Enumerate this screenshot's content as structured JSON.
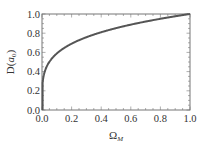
{
  "chart_data": {
    "type": "line",
    "title": "",
    "xlabel": "Ω_M",
    "xlabel_main": "Ω",
    "xlabel_sub": "M",
    "ylabel": "D(a_0)",
    "ylabel_main": "D(",
    "ylabel_var": "a",
    "ylabel_sub": "0",
    "ylabel_close": ")",
    "xlim": [
      0.0,
      1.0
    ],
    "ylim": [
      0.0,
      1.0
    ],
    "xticks": [
      "0.0",
      "0.2",
      "0.4",
      "0.6",
      "0.8",
      "1.0"
    ],
    "yticks": [
      "0.0",
      "0.2",
      "0.4",
      "0.6",
      "0.8",
      "1.0"
    ],
    "grid": false,
    "legend": null,
    "series": [
      {
        "name": "D(a_0)",
        "color": "#555555",
        "x": [
          0.0,
          0.002,
          0.005,
          0.01,
          0.02,
          0.03,
          0.05,
          0.075,
          0.1,
          0.15,
          0.2,
          0.3,
          0.4,
          0.5,
          0.6,
          0.7,
          0.8,
          0.9,
          1.0
        ],
        "y": [
          0.0,
          0.24,
          0.3,
          0.35,
          0.41,
          0.45,
          0.5,
          0.55,
          0.59,
          0.65,
          0.69,
          0.76,
          0.81,
          0.85,
          0.89,
          0.92,
          0.95,
          0.98,
          1.0
        ]
      }
    ]
  }
}
